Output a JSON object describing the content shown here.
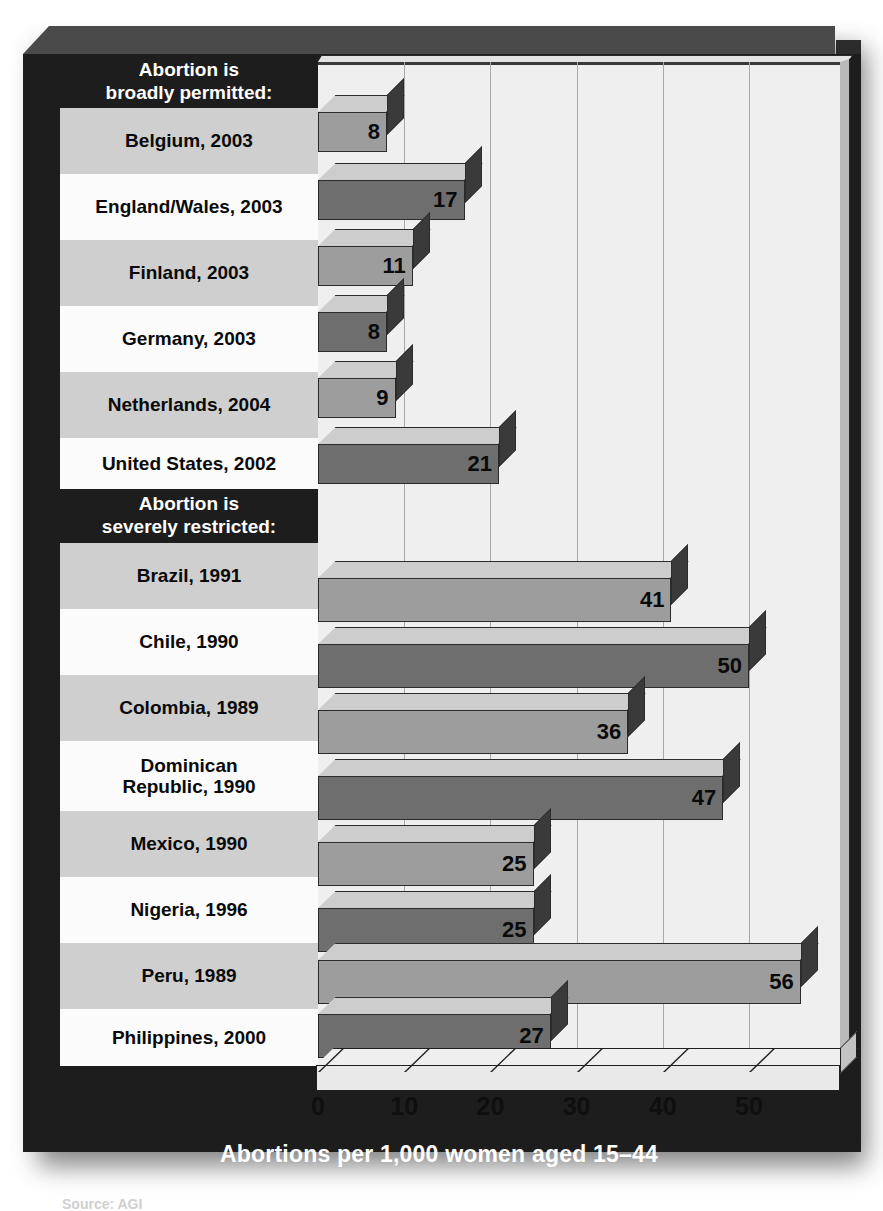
{
  "chart_data": {
    "type": "bar",
    "orientation": "horizontal",
    "title": "",
    "xlabel": "Abortions per 1,000 women aged 15–44",
    "ylabel": "",
    "xlim": [
      0,
      60
    ],
    "xticks": [
      0,
      10,
      20,
      30,
      40,
      50
    ],
    "xtick_labels": [
      "0",
      "10",
      "20",
      "30",
      "40",
      "50"
    ],
    "grid": true,
    "legend": "none",
    "groups": [
      {
        "header": "Abortion is\nbroadly permitted:",
        "header_line1": "Abortion is",
        "header_line2": "broadly permitted:",
        "categories": [
          "Belgium, 2003",
          "England/Wales, 2003",
          "Finland, 2003",
          "Germany, 2003",
          "Netherlands, 2004",
          "United States, 2002"
        ],
        "values": [
          8,
          17,
          11,
          8,
          9,
          21
        ]
      },
      {
        "header": "Abortion is\nseverely restricted:",
        "header_line1": "Abortion is",
        "header_line2": "severely restricted:",
        "categories": [
          "Brazil, 1991",
          "Chile, 1990",
          "Colombia, 1989",
          "Dominican Republic, 1990",
          "Mexico, 1990",
          "Nigeria, 1996",
          "Peru, 1989",
          "Philippines, 2000"
        ],
        "values": [
          41,
          50,
          36,
          47,
          25,
          25,
          56,
          27
        ]
      }
    ]
  },
  "rows": [
    {
      "label": "Belgium, 2003",
      "label_l1": "Belgium, 2003",
      "label_l2": "",
      "value": 8,
      "value_text": "8"
    },
    {
      "label": "England/Wales, 2003",
      "label_l1": "England/Wales, 2003",
      "label_l2": "",
      "value": 17,
      "value_text": "17"
    },
    {
      "label": "Finland, 2003",
      "label_l1": "Finland, 2003",
      "label_l2": "",
      "value": 11,
      "value_text": "11"
    },
    {
      "label": "Germany, 2003",
      "label_l1": "Germany, 2003",
      "label_l2": "",
      "value": 8,
      "value_text": "8"
    },
    {
      "label": "Netherlands, 2004",
      "label_l1": "Netherlands, 2004",
      "label_l2": "",
      "value": 9,
      "value_text": "9"
    },
    {
      "label": "United States, 2002",
      "label_l1": "United States, 2002",
      "label_l2": "",
      "value": 21,
      "value_text": "21"
    },
    {
      "label": "Brazil, 1991",
      "label_l1": "Brazil, 1991",
      "label_l2": "",
      "value": 41,
      "value_text": "41"
    },
    {
      "label": "Chile, 1990",
      "label_l1": "Chile, 1990",
      "label_l2": "",
      "value": 50,
      "value_text": "50"
    },
    {
      "label": "Colombia, 1989",
      "label_l1": "Colombia, 1989",
      "label_l2": "",
      "value": 36,
      "value_text": "36"
    },
    {
      "label": "Dominican Republic, 1990",
      "label_l1": "Dominican",
      "label_l2": "Republic, 1990",
      "value": 47,
      "value_text": "47"
    },
    {
      "label": "Mexico, 1990",
      "label_l1": "Mexico, 1990",
      "label_l2": "",
      "value": 25,
      "value_text": "25"
    },
    {
      "label": "Nigeria, 1996",
      "label_l1": "Nigeria, 1996",
      "label_l2": "",
      "value": 25,
      "value_text": "25"
    },
    {
      "label": "Peru, 1989",
      "label_l1": "Peru, 1989",
      "label_l2": "",
      "value": 56,
      "value_text": "56"
    },
    {
      "label": "Philippines, 2000",
      "label_l1": "Philippines, 2000",
      "label_l2": "",
      "value": 27,
      "value_text": "27"
    }
  ],
  "headers": {
    "group1_line1": "Abortion is",
    "group1_line2": "broadly permitted:",
    "group2_line1": "Abortion is",
    "group2_line2": "severely restricted:"
  },
  "axis": {
    "caption": "Abortions per 1,000 women aged 15–44",
    "ticks": [
      "0",
      "10",
      "20",
      "30",
      "40",
      "50"
    ]
  },
  "source_note": "Source: AGI",
  "colors": {
    "frame_dark": "#1d1d1d",
    "frame_bevel": "#4a4a4a",
    "panel": "#efefef",
    "stripe_light": "#cfcfcf",
    "stripe_white": "#fbfbfb",
    "bar_dark": "#6e6e6e",
    "bar_light": "#9d9d9d",
    "bar_top": "#cdcdcd",
    "bar_side": "#3a3a3a",
    "gridline": "#a8a8a8",
    "text_dark": "#0a0a0a",
    "text_light": "#ffffff"
  }
}
